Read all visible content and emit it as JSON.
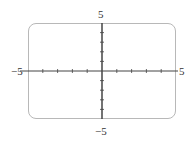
{
  "chart_data": {
    "type": "line",
    "title": "",
    "xlabel": "",
    "ylabel": "",
    "xlim": [
      -5,
      5
    ],
    "ylim": [
      -5,
      5
    ],
    "grid": false,
    "series": [],
    "tick_labels": {
      "x_min": "−5",
      "x_max": "5",
      "y_min": "−5",
      "y_max": "5"
    },
    "ticks_per_axis": 10
  },
  "colors": {
    "frame": "#b8b8b8",
    "axis": "#444444"
  }
}
